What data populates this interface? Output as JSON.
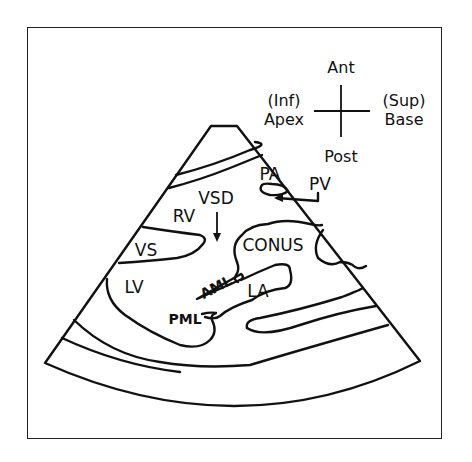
{
  "figure": {
    "type": "echocardiogram-schematic",
    "view": "parasternal long-axis sector"
  },
  "orientation": {
    "top": "Ant",
    "bottom": "Post",
    "left_line1": "(Inf)",
    "left_line2": "Apex",
    "right_line1": "(Sup)",
    "right_line2": "Base"
  },
  "labels": {
    "pa": "PA",
    "pv": "PV",
    "vsd": "VSD",
    "rv": "RV",
    "vs": "VS",
    "conus": "CONUS",
    "lv": "LV",
    "aml": "AML",
    "la": "LA",
    "pml": "PML"
  },
  "colors": {
    "line": "#111111",
    "background": "#ffffff"
  }
}
